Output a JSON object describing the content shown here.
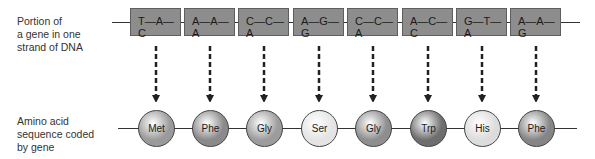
{
  "labels": {
    "dna": "Portion of\na gene in one\nstrand of DNA",
    "amino": "Amino acid\nsequence coded\nby gene"
  },
  "dna_codons": [
    {
      "text": "T—A—C",
      "x": 130
    },
    {
      "text": "A—A—A",
      "x": 184
    },
    {
      "text": "C—C—A",
      "x": 238
    },
    {
      "text": "A—G—G",
      "x": 293
    },
    {
      "text": "C—C—A",
      "x": 347
    },
    {
      "text": "A—C—C",
      "x": 402
    },
    {
      "text": "G—T—A",
      "x": 456
    },
    {
      "text": "A—A—G",
      "x": 510
    }
  ],
  "amino_acids": [
    {
      "name": "Met",
      "color": "#9a9a9a"
    },
    {
      "name": "Phe",
      "color": "#8a8a8a"
    },
    {
      "name": "Gly",
      "color": "#9c9c9c"
    },
    {
      "name": "Ser",
      "color": "#e4e4e4"
    },
    {
      "name": "Gly",
      "color": "#8e8e8e"
    },
    {
      "name": "Trp",
      "color": "#6e6e6e"
    },
    {
      "name": "His",
      "color": "#dcdcdc"
    },
    {
      "name": "Phe",
      "color": "#858585"
    }
  ],
  "colors": {
    "codon_fill": "#8d8d8d",
    "line": "#333333",
    "arrow": "#222222"
  }
}
